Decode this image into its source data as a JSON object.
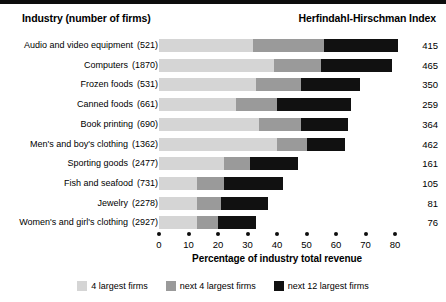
{
  "header": {
    "left_title": "Industry (number of firms)",
    "right_title": "Herfindahl-Hirschman Index"
  },
  "chart_data": {
    "type": "bar",
    "orientation": "horizontal",
    "stacked": true,
    "title": "",
    "xlabel": "Percentage of industry total revenue",
    "ylabel": "Industry (number of firms)",
    "xlim": [
      0,
      80
    ],
    "xticks": [
      0,
      10,
      20,
      30,
      40,
      50,
      60,
      70,
      80
    ],
    "grid": false,
    "legend_position": "bottom",
    "categories": [
      "Audio and video equipment",
      "Computers",
      "Frozen foods",
      "Canned foods",
      "Book printing",
      "Men's and boy's clothing",
      "Sporting goods",
      "Fish and seafood",
      "Jewelry",
      "Women's and girl's clothing"
    ],
    "firm_counts": [
      "(521)",
      "(1870)",
      "(531)",
      "(661)",
      "(690)",
      "(1362)",
      "(2477)",
      "(731)",
      "(2278)",
      "(2927)"
    ],
    "series": [
      {
        "name": "4 largest firms",
        "color": "#d5d5d5",
        "values": [
          32,
          39,
          33,
          26,
          34,
          40,
          22,
          13,
          13,
          13
        ]
      },
      {
        "name": "next 4 largest firms",
        "color": "#9a9a9a",
        "values": [
          24,
          16,
          15,
          14,
          14,
          10,
          9,
          9,
          8,
          7
        ]
      },
      {
        "name": "next 12 largest firms",
        "color": "#111111",
        "values": [
          25,
          24,
          20,
          25,
          16,
          13,
          16,
          20,
          16,
          13
        ]
      }
    ],
    "hhi_label": "Herfindahl-Hirschman Index",
    "hhi_values": [
      415,
      465,
      350,
      259,
      364,
      462,
      161,
      105,
      81,
      76
    ]
  },
  "rows": [
    {
      "label": "Audio and video equipment",
      "count": "(521)",
      "top4": 32,
      "next4": 24,
      "next12": 25,
      "hhi": "415"
    },
    {
      "label": "Computers",
      "count": "(1870)",
      "top4": 39,
      "next4": 16,
      "next12": 24,
      "hhi": "465"
    },
    {
      "label": "Frozen foods",
      "count": "(531)",
      "top4": 33,
      "next4": 15,
      "next12": 20,
      "hhi": "350"
    },
    {
      "label": "Canned foods",
      "count": "(661)",
      "top4": 26,
      "next4": 14,
      "next12": 25,
      "hhi": "259"
    },
    {
      "label": "Book printing",
      "count": "(690)",
      "top4": 34,
      "next4": 14,
      "next12": 16,
      "hhi": "364"
    },
    {
      "label": "Men's and boy's clothing",
      "count": "(1362)",
      "top4": 40,
      "next4": 10,
      "next12": 13,
      "hhi": "462"
    },
    {
      "label": "Sporting goods",
      "count": "(2477)",
      "top4": 22,
      "next4": 9,
      "next12": 16,
      "hhi": "161"
    },
    {
      "label": "Fish and seafood",
      "count": "(731)",
      "top4": 13,
      "next4": 9,
      "next12": 20,
      "hhi": "105"
    },
    {
      "label": "Jewelry",
      "count": "(2278)",
      "top4": 13,
      "next4": 8,
      "next12": 16,
      "hhi": "81"
    },
    {
      "label": "Women's and girl's clothing",
      "count": "(2927)",
      "top4": 13,
      "next4": 7,
      "next12": 13,
      "hhi": "76"
    }
  ],
  "axis": {
    "ticks": [
      "0",
      "10",
      "20",
      "30",
      "40",
      "50",
      "60",
      "70",
      "80"
    ],
    "title": "Percentage of industry total revenue"
  },
  "legend": [
    {
      "label": "4 largest firms",
      "color": "#d5d5d5"
    },
    {
      "label": "next 4 largest firms",
      "color": "#9a9a9a"
    },
    {
      "label": "next 12 largest firms",
      "color": "#111111"
    }
  ],
  "colors": {
    "top4": "#d5d5d5",
    "next4": "#9a9a9a",
    "next12": "#111111",
    "rule": "#0d0d0d",
    "background": "#ffffff"
  }
}
